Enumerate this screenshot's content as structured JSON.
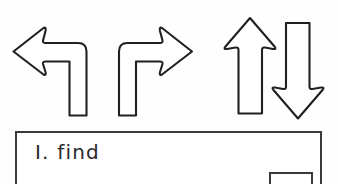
{
  "page": {
    "background_color": "#fefefe",
    "ink_color": "#231f20"
  },
  "arrows": {
    "label": "direction arrow row",
    "items": [
      {
        "id": "turn-left-arrow",
        "name": "arrow-turn-left",
        "direction": "left",
        "description": "arrow rising from bottom then turning to point left"
      },
      {
        "id": "turn-right-arrow",
        "name": "arrow-turn-right",
        "direction": "right",
        "description": "arrow rising from bottom then turning to point right"
      },
      {
        "id": "up-arrow",
        "name": "arrow-up",
        "direction": "up",
        "description": "straight arrow pointing up"
      },
      {
        "id": "down-arrow",
        "name": "arrow-down",
        "direction": "down",
        "description": "straight arrow pointing down"
      }
    ]
  },
  "panel": {
    "item_text": "I. find",
    "border_color": "#3a3a3a",
    "answer_box": {
      "name": "answer-box",
      "value": ""
    }
  }
}
